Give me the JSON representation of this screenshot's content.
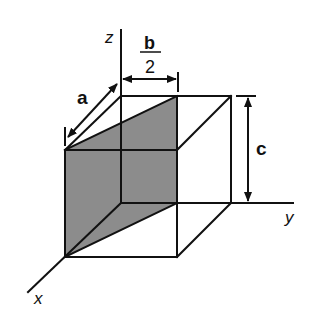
{
  "diagram": {
    "type": "3d-box-with-shaded-plane",
    "colors": {
      "stroke": "#111111",
      "shade": "#8c8c8c",
      "background": "#ffffff"
    },
    "axes": {
      "x": "x",
      "y": "y",
      "z": "z"
    },
    "dimensions": {
      "a": "a",
      "b_numerator": "b",
      "b_denominator": "2",
      "c": "c"
    }
  }
}
